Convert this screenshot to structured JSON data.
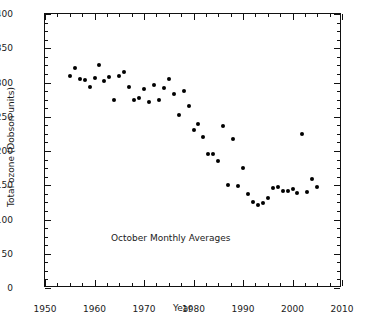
{
  "chart_data": {
    "type": "scatter",
    "title": "",
    "xlabel": "Year",
    "ylabel": "Total ozone (Dobson units)",
    "annotation": "October Monthly Averages",
    "xlim": [
      1950,
      2010
    ],
    "ylim": [
      0,
      400
    ],
    "xticks": [
      1950,
      1960,
      1970,
      1980,
      1990,
      2000,
      2010
    ],
    "xticklabels": [
      "1950",
      "1960",
      "1970",
      "1980",
      "1990",
      "2000",
      "2010"
    ],
    "yticks": [
      0,
      50,
      100,
      150,
      200,
      250,
      300,
      350,
      400
    ],
    "yticklabels": [
      "0",
      "50",
      "100",
      "150",
      "200",
      "250",
      "300",
      "350",
      "400"
    ],
    "x_minor_step": 2.5,
    "y_minor_step": 12.5,
    "grid": false,
    "legend": null,
    "marker_color": "#000000",
    "marker_size_px": 4,
    "series": [
      {
        "name": "Total ozone (October monthly average)",
        "points": [
          {
            "x": 1955,
            "y": 310
          },
          {
            "x": 1956,
            "y": 321
          },
          {
            "x": 1957,
            "y": 305
          },
          {
            "x": 1958,
            "y": 303
          },
          {
            "x": 1959,
            "y": 293
          },
          {
            "x": 1960,
            "y": 307
          },
          {
            "x": 1961,
            "y": 325
          },
          {
            "x": 1962,
            "y": 302
          },
          {
            "x": 1963,
            "y": 308
          },
          {
            "x": 1964,
            "y": 275
          },
          {
            "x": 1965,
            "y": 309
          },
          {
            "x": 1966,
            "y": 315
          },
          {
            "x": 1967,
            "y": 294
          },
          {
            "x": 1968,
            "y": 275
          },
          {
            "x": 1969,
            "y": 277
          },
          {
            "x": 1970,
            "y": 290
          },
          {
            "x": 1971,
            "y": 272
          },
          {
            "x": 1972,
            "y": 296
          },
          {
            "x": 1973,
            "y": 274
          },
          {
            "x": 1974,
            "y": 292
          },
          {
            "x": 1975,
            "y": 305
          },
          {
            "x": 1976,
            "y": 283
          },
          {
            "x": 1977,
            "y": 252
          },
          {
            "x": 1978,
            "y": 287
          },
          {
            "x": 1979,
            "y": 266
          },
          {
            "x": 1980,
            "y": 230
          },
          {
            "x": 1981,
            "y": 239
          },
          {
            "x": 1982,
            "y": 221
          },
          {
            "x": 1983,
            "y": 196
          },
          {
            "x": 1984,
            "y": 195
          },
          {
            "x": 1985,
            "y": 186
          },
          {
            "x": 1986,
            "y": 236
          },
          {
            "x": 1987,
            "y": 150
          },
          {
            "x": 1988,
            "y": 218
          },
          {
            "x": 1989,
            "y": 149
          },
          {
            "x": 1990,
            "y": 175
          },
          {
            "x": 1991,
            "y": 137
          },
          {
            "x": 1992,
            "y": 126
          },
          {
            "x": 1993,
            "y": 121
          },
          {
            "x": 1994,
            "y": 124
          },
          {
            "x": 1995,
            "y": 131
          },
          {
            "x": 1996,
            "y": 146
          },
          {
            "x": 1997,
            "y": 148
          },
          {
            "x": 1998,
            "y": 142
          },
          {
            "x": 1999,
            "y": 141
          },
          {
            "x": 2000,
            "y": 145
          },
          {
            "x": 2001,
            "y": 138
          },
          {
            "x": 2002,
            "y": 225
          },
          {
            "x": 2003,
            "y": 140
          },
          {
            "x": 2004,
            "y": 159
          },
          {
            "x": 2005,
            "y": 148
          }
        ]
      }
    ]
  },
  "caption": {
    "partial_text": ""
  }
}
